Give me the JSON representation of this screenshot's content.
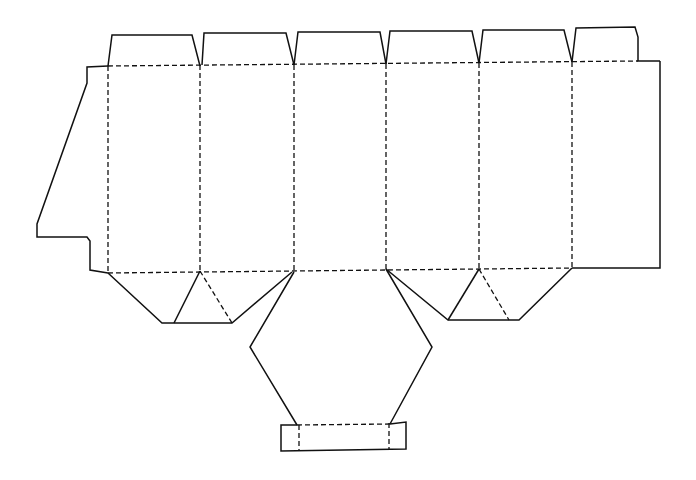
{
  "diagram": {
    "colors": {
      "line": "#111111",
      "background": "#ffffff"
    },
    "legend": {
      "cut_line": "solid",
      "fold_line": "dashed"
    },
    "panels": {
      "count": 6,
      "fold_x": [
        108,
        200,
        294,
        386,
        479,
        572
      ],
      "right_edge_x": 660,
      "top_fold_y": [
        66,
        61
      ],
      "bottom_fold_y": [
        273,
        269
      ]
    },
    "top_tabs": [
      {
        "id": "tab-1",
        "points": "108,66 112,35 192,35 200,66"
      },
      {
        "id": "tab-2",
        "points": "202,65 204,33 286,33 294,65"
      },
      {
        "id": "tab-3",
        "points": "294,65 298,32 380,32 386,64"
      },
      {
        "id": "tab-4",
        "points": "386,64 390,31 472,31 479,63"
      },
      {
        "id": "tab-5",
        "points": "479,63 483,30 564,30 572,62"
      },
      {
        "id": "tab-6",
        "points": "572,62 576,28 635,27 638,37 638,61 660,61"
      }
    ],
    "glue_flap": {
      "points": "108,66 87,67 87,83 37,224 37,237 87,237 90,241 90,270 108,273"
    },
    "bottom_flaps": [
      {
        "id": "bottom-flap-left",
        "outline": "108,273 162,323 232,323 292,272",
        "inner_cut": "200,271 174,323",
        "inner_fold": "200,271 232,323"
      },
      {
        "id": "bottom-flap-right",
        "outline": "386,269 448,320 519,320 572,268",
        "inner_cut": "479,269 448,320",
        "inner_fold": "479,269 509,320"
      }
    ],
    "base_flap": {
      "outline": "294,272 250,347 297,425",
      "outline_right": "386,269 432,347 390,424",
      "tongue_outer": "297,425 281,425 281,451 406,449 406,422 390,424",
      "tongue_fold": "297,425 390,424",
      "tongue_fold_left": "299,425 299,450",
      "tongue_fold_right": "389,423 389,449"
    }
  }
}
